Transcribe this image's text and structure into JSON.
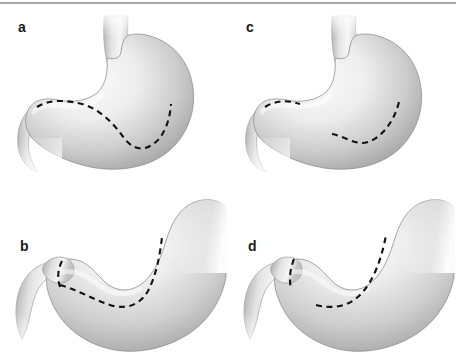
{
  "figure": {
    "background_color": "#ffffff",
    "rule_color": "#a8a8a8",
    "dash_color": "#111111",
    "organ_light": "#f2f2f2",
    "organ_mid": "#d8d8d8",
    "organ_dark": "#9a9a9a",
    "organ_outline": "#8e8e8e"
  },
  "panels": [
    {
      "id": "a",
      "label": "a",
      "view": "upright-stomach",
      "description": "Upright stomach with vertical esophagus entering at top, rounded fundus and body to the right, antrum and pylorus curving to the lower left; a single continuous dashed line runs along the inner lesser curvature from the pylorus to the body.",
      "dashed_lines": 1,
      "dashed_gap": false
    },
    {
      "id": "b",
      "label": "b",
      "view": "rotated-stomach",
      "description": "Rotated, foreshortened stomach seen from below with duodenum descending at the left; a short angled dashed segment crosses the pyloric canal and joins a long dashed line sweeping along the greater curvature into the body.",
      "dashed_lines": 2,
      "dashed_gap": false
    },
    {
      "id": "c",
      "label": "c",
      "view": "upright-stomach",
      "description": "Upright stomach identical in outline to panel a, but the dashed line is interrupted: a short dashed segment over the antrum and a separate longer dashed segment along the body, with a clear gap between them.",
      "dashed_lines": 2,
      "dashed_gap": true
    },
    {
      "id": "d",
      "label": "d",
      "view": "rotated-stomach",
      "description": "Rotated stomach identical in outline to panel b, but with a short vertical dashed line across the pylorus and a separate curved dashed line along the body, the two not meeting.",
      "dashed_lines": 2,
      "dashed_gap": true
    }
  ]
}
